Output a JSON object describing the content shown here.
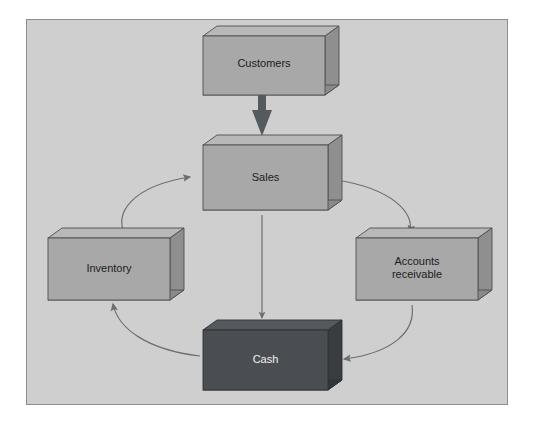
{
  "diagram": {
    "type": "flow-diagram",
    "frame": {
      "background_color": "#cfcfcf",
      "border_color": "#8d8d8d",
      "page_background": "#ffffff"
    },
    "palette": {
      "box_face_light": "#a8a8a8",
      "box_side_light": "#8f8f8f",
      "box_top_light": "#b8b8b8",
      "box_bottom_light": "#8a8a8a",
      "box_face_dark": "#4a4e52",
      "box_side_dark": "#3a3d40",
      "box_top_dark": "#55595d",
      "box_bottom_dark": "#33363a",
      "box_outline": "#4f4f4f",
      "thick_arrow": "#555a5e",
      "thin_arrow": "#6a6f73",
      "curve_arrow": "#6a6f73",
      "text_dark": "#1c1c1c",
      "text_light": "#f2f2f2"
    },
    "nodes": [
      {
        "id": "customers",
        "label": "Customers",
        "style": "light",
        "x": 203,
        "y": 36,
        "width": 122,
        "height": 59,
        "text_color": "#1c1c1c",
        "font_size": 11
      },
      {
        "id": "sales",
        "label": "Sales",
        "style": "light",
        "x": 203,
        "y": 145,
        "width": 125,
        "height": 65,
        "text_color": "#1c1c1c",
        "font_size": 11
      },
      {
        "id": "inventory",
        "label": "Inventory",
        "style": "light",
        "x": 48,
        "y": 238,
        "width": 122,
        "height": 62,
        "text_color": "#1c1c1c",
        "font_size": 11
      },
      {
        "id": "accounts-receivable",
        "label": "Accounts\nreceivable",
        "style": "light",
        "x": 356,
        "y": 238,
        "width": 122,
        "height": 62,
        "text_color": "#1c1c1c",
        "font_size": 11
      },
      {
        "id": "cash",
        "label": "Cash",
        "style": "dark",
        "x": 203,
        "y": 330,
        "width": 125,
        "height": 60,
        "text_color": "#f2f2f2",
        "font_size": 11
      }
    ],
    "connectors": [
      {
        "id": "customers-to-sales",
        "from": "customers",
        "to": "sales",
        "kind": "thick-straight",
        "direction": "down",
        "color": "#555a5e"
      },
      {
        "id": "sales-to-cash",
        "from": "sales",
        "to": "cash",
        "kind": "thin-straight",
        "direction": "down",
        "color": "#6a6f73"
      },
      {
        "id": "inventory-to-sales",
        "from": "inventory",
        "to": "sales",
        "kind": "curve",
        "direction": "up-right",
        "color": "#6a6f73"
      },
      {
        "id": "sales-to-accounts-receivable",
        "from": "sales",
        "to": "accounts-receivable",
        "kind": "curve",
        "direction": "down-right",
        "color": "#6a6f73"
      },
      {
        "id": "accounts-receivable-to-cash",
        "from": "accounts-receivable",
        "to": "cash",
        "kind": "curve",
        "direction": "down-left",
        "color": "#6a6f73"
      },
      {
        "id": "cash-to-inventory",
        "from": "cash",
        "to": "inventory",
        "kind": "curve",
        "direction": "up-left",
        "color": "#6a6f73"
      }
    ]
  }
}
